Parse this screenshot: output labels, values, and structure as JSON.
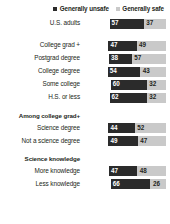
{
  "legend": {
    "items": [
      {
        "label": "Generally unsafe",
        "color": "#2b2b2b",
        "icon": "square-swatch-icon"
      },
      {
        "label": "Generally safe",
        "color": "#c9c9c9",
        "icon": "square-swatch-icon"
      }
    ]
  },
  "chart_data": {
    "type": "bar",
    "subtype": "diverging-stacked-bar",
    "title": "",
    "xlabel": "",
    "ylabel": "",
    "xlim": [
      0,
      100
    ],
    "grid": false,
    "legend_position": "top-right",
    "series": [
      {
        "name": "Generally unsafe",
        "color": "#2b2b2b"
      },
      {
        "name": "Generally safe",
        "color": "#c9c9c9"
      }
    ],
    "categories": [
      "U.S. adults",
      "College grad +",
      "Postgrad degree",
      "College degree",
      "Some college",
      "H.S. or less",
      "Science degree",
      "Not a science degree",
      "More knowledge",
      "Less knowledge"
    ],
    "values": {
      "Generally unsafe": [
        57,
        47,
        38,
        54,
        60,
        62,
        44,
        49,
        47,
        66
      ],
      "Generally safe": [
        37,
        49,
        57,
        43,
        32,
        32,
        52,
        47,
        48,
        26
      ]
    }
  },
  "groups": [
    {
      "header": "",
      "rows": [
        {
          "label": "U.S. adults",
          "unsafe": 57,
          "safe": 37
        }
      ]
    },
    {
      "header": "",
      "rows": [
        {
          "label": "College grad +",
          "unsafe": 47,
          "safe": 49
        },
        {
          "label": "Postgrad degree",
          "unsafe": 38,
          "safe": 57
        },
        {
          "label": "College degree",
          "unsafe": 54,
          "safe": 43
        },
        {
          "label": "Some college",
          "unsafe": 60,
          "safe": 32
        },
        {
          "label": "H.S. or less",
          "unsafe": 62,
          "safe": 32
        }
      ]
    },
    {
      "header": "Among college grad+",
      "rows": [
        {
          "label": "Science degree",
          "unsafe": 44,
          "safe": 52
        },
        {
          "label": "Not a science degree",
          "unsafe": 49,
          "safe": 47
        }
      ]
    },
    {
      "header": "Science knowledge",
      "rows": [
        {
          "label": "More knowledge",
          "unsafe": 47,
          "safe": 48
        },
        {
          "label": "Less knowledge",
          "unsafe": 66,
          "safe": 26
        }
      ]
    }
  ]
}
